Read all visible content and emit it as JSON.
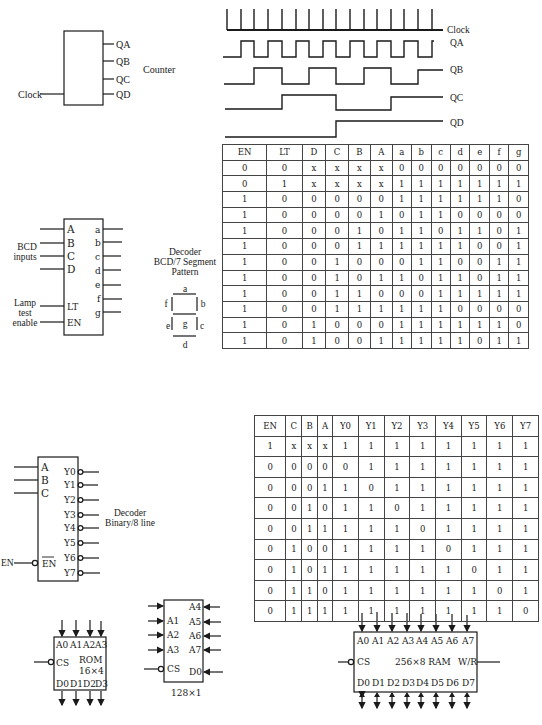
{
  "counter": {
    "title": "Counter",
    "input_label": "Clock",
    "outputs": [
      "QA",
      "QB",
      "QC",
      "QD"
    ]
  },
  "timing_diagram": {
    "signals": [
      "Clock",
      "QA",
      "QB",
      "QC",
      "QD"
    ]
  },
  "seven_segment_decoder": {
    "title_line1": "Decoder",
    "title_line2": "BCD/7 Segment",
    "title_line3": "Pattern",
    "inputs": [
      "A",
      "B",
      "C",
      "D"
    ],
    "control_pins": [
      "LT",
      "EN"
    ],
    "outputs": [
      "a",
      "b",
      "c",
      "d",
      "e",
      "f",
      "g"
    ],
    "bcd_label_1": "BCD",
    "bcd_label_2": "inputs",
    "lamp_label_1": "Lamp",
    "lamp_label_2": "test",
    "lamp_label_3": "enable",
    "segment_labels": {
      "a": "a",
      "b": "b",
      "c": "c",
      "d": "d",
      "e": "e",
      "f": "f",
      "g": "g"
    }
  },
  "seven_segment_table": {
    "headers": [
      "EN",
      "LT",
      "D",
      "C",
      "B",
      "A",
      "a",
      "b",
      "c",
      "d",
      "e",
      "f",
      "g"
    ],
    "rows": [
      [
        "0",
        "0",
        "x",
        "x",
        "x",
        "x",
        "0",
        "0",
        "0",
        "0",
        "0",
        "0",
        "0"
      ],
      [
        "0",
        "1",
        "x",
        "x",
        "x",
        "x",
        "1",
        "1",
        "1",
        "1",
        "1",
        "1",
        "1"
      ],
      [
        "1",
        "0",
        "0",
        "0",
        "0",
        "0",
        "1",
        "1",
        "1",
        "1",
        "1",
        "1",
        "0"
      ],
      [
        "1",
        "0",
        "0",
        "0",
        "0",
        "1",
        "0",
        "1",
        "1",
        "0",
        "0",
        "0",
        "0"
      ],
      [
        "1",
        "0",
        "0",
        "0",
        "1",
        "0",
        "1",
        "1",
        "0",
        "1",
        "1",
        "0",
        "1"
      ],
      [
        "1",
        "0",
        "0",
        "0",
        "1",
        "1",
        "1",
        "1",
        "1",
        "1",
        "0",
        "0",
        "1"
      ],
      [
        "1",
        "0",
        "0",
        "1",
        "0",
        "0",
        "0",
        "1",
        "1",
        "0",
        "0",
        "1",
        "1"
      ],
      [
        "1",
        "0",
        "0",
        "1",
        "0",
        "1",
        "1",
        "0",
        "1",
        "1",
        "0",
        "1",
        "1"
      ],
      [
        "1",
        "0",
        "0",
        "1",
        "1",
        "0",
        "0",
        "0",
        "1",
        "1",
        "1",
        "1",
        "1"
      ],
      [
        "1",
        "0",
        "0",
        "1",
        "1",
        "1",
        "1",
        "1",
        "1",
        "0",
        "0",
        "0",
        "0"
      ],
      [
        "1",
        "0",
        "1",
        "0",
        "0",
        "0",
        "1",
        "1",
        "1",
        "1",
        "1",
        "1",
        "0"
      ],
      [
        "1",
        "0",
        "1",
        "0",
        "0",
        "1",
        "1",
        "1",
        "1",
        "1",
        "0",
        "1",
        "1"
      ]
    ]
  },
  "binary_decoder": {
    "title_line1": "Decoder",
    "title_line2": "Binary/8 line",
    "inputs": [
      "A",
      "B",
      "C"
    ],
    "enable_pin": "EN",
    "enable_input_label": "EN",
    "outputs": [
      "Y0",
      "Y1",
      "Y2",
      "Y3",
      "Y4",
      "Y5",
      "Y6",
      "Y7"
    ]
  },
  "binary_decoder_table": {
    "headers": [
      "EN",
      "C",
      "B",
      "A",
      "Y0",
      "Y1",
      "Y2",
      "Y3",
      "Y4",
      "Y5",
      "Y6",
      "Y7"
    ],
    "rows": [
      [
        "1",
        "x",
        "x",
        "x",
        "1",
        "1",
        "1",
        "1",
        "1",
        "1",
        "1",
        "1"
      ],
      [
        "0",
        "0",
        "0",
        "0",
        "0",
        "1",
        "1",
        "1",
        "1",
        "1",
        "1",
        "1"
      ],
      [
        "0",
        "0",
        "0",
        "1",
        "1",
        "0",
        "1",
        "1",
        "1",
        "1",
        "1",
        "1"
      ],
      [
        "0",
        "0",
        "1",
        "0",
        "1",
        "1",
        "0",
        "1",
        "1",
        "1",
        "1",
        "1"
      ],
      [
        "0",
        "0",
        "1",
        "1",
        "1",
        "1",
        "1",
        "0",
        "1",
        "1",
        "1",
        "1"
      ],
      [
        "0",
        "1",
        "0",
        "0",
        "1",
        "1",
        "1",
        "1",
        "0",
        "1",
        "1",
        "1"
      ],
      [
        "0",
        "1",
        "0",
        "1",
        "1",
        "1",
        "1",
        "1",
        "1",
        "0",
        "1",
        "1"
      ],
      [
        "0",
        "1",
        "1",
        "0",
        "1",
        "1",
        "1",
        "1",
        "1",
        "1",
        "0",
        "1"
      ],
      [
        "0",
        "1",
        "1",
        "1",
        "1",
        "1",
        "1",
        "1",
        "1",
        "1",
        "1",
        "0"
      ]
    ]
  },
  "rom": {
    "name": "ROM",
    "size": "16×4",
    "address_pins": [
      "A0",
      "A1",
      "A2",
      "A3"
    ],
    "data_pins": [
      "D0",
      "D1",
      "D2",
      "D3"
    ],
    "cs_pin": "CS"
  },
  "memory_128x1": {
    "size": "128×1",
    "left_pins": [
      "A1",
      "A2",
      "A3"
    ],
    "right_pins": [
      "A4",
      "A5",
      "A6",
      "A7",
      "D0"
    ],
    "cs_pin": "CS"
  },
  "ram": {
    "label": "256×8 RAM",
    "address_pins": [
      "A0",
      "A1",
      "A2",
      "A3",
      "A4",
      "A5",
      "A6",
      "A7"
    ],
    "data_pins": [
      "D0",
      "D1",
      "D2",
      "D3",
      "D4",
      "D5",
      "D6",
      "D7"
    ],
    "cs_pin": "CS",
    "wr_pin": "W/R"
  }
}
